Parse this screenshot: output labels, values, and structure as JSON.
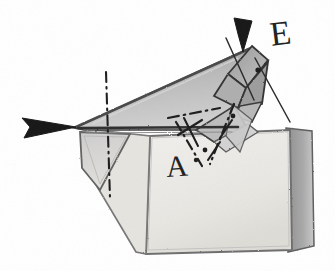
{
  "diagram": {
    "type": "origami-folding-step",
    "background_color": "#ffffff",
    "ink_color": "#232323",
    "labels": [
      {
        "id": "label-A",
        "text": "A",
        "x": 165,
        "y": 152,
        "rotation_deg": -4,
        "font_size_px": 30
      },
      {
        "id": "label-E",
        "text": "E",
        "x": 268,
        "y": 18,
        "rotation_deg": -7,
        "font_size_px": 34
      }
    ],
    "arrows": [
      {
        "name": "left-fold-arrow",
        "direction": "right",
        "style": "solid-filled-triangle",
        "tip_x": 78,
        "tip_y": 127
      },
      {
        "name": "top-fold-arrow",
        "direction": "down-left",
        "style": "solid-tapered-spike",
        "tip_x": 240,
        "tip_y": 48
      }
    ],
    "axis_lines": [
      {
        "name": "vertical-axis-line",
        "style": "dash-dot",
        "from": [
          105,
          72
        ],
        "to": [
          109,
          198
        ]
      },
      {
        "name": "diagonal-axis-line-upper",
        "style": "solid-thin",
        "from": [
          228,
          40
        ],
        "to": [
          250,
          96
        ]
      },
      {
        "name": "diagonal-axis-line-right",
        "style": "solid-thin",
        "from": [
          258,
          62
        ],
        "to": [
          288,
          120
        ]
      }
    ],
    "crease_lines": [
      {
        "name": "main-fold-edge",
        "style": "solid-heavy",
        "from": [
          78,
          127
        ],
        "to": [
          238,
          127
        ]
      },
      {
        "name": "crease-dash-dot-center",
        "style": "dash-dot",
        "from": [
          170,
          113
        ],
        "to": [
          216,
          130
        ]
      },
      {
        "name": "crease-dash-dot-lower",
        "style": "dash-dot",
        "from": [
          182,
          123
        ],
        "to": [
          205,
          164
        ]
      },
      {
        "name": "crease-dash-dot-right",
        "style": "dash-dot",
        "from": [
          232,
          108
        ],
        "to": [
          212,
          162
        ]
      }
    ],
    "shapes": [
      {
        "name": "upper-body-wedge",
        "fill": "#b4b4b4",
        "stroke": "#3a3a3a",
        "role": "folded-gray-body"
      },
      {
        "name": "folded-tip-facets",
        "fill": "#a8a8a8",
        "stroke": "#2f2f2f",
        "role": "apex-facets"
      },
      {
        "name": "left-flap-triangle",
        "fill": "#d5d5d5",
        "stroke": "#555555",
        "role": "left-wing-flap"
      },
      {
        "name": "paper-sheet",
        "fill": "#eceae6",
        "stroke": "#6b6b6b",
        "role": "base-paper"
      },
      {
        "name": "paper-sheet-edge",
        "fill": "#9e9e9e",
        "stroke": "#5a5a5a",
        "role": "paper-thickness"
      }
    ],
    "colors": {
      "body_gray": "#b4b4b4",
      "facet_gray": "#a8a8a8",
      "flap_gray": "#d5d5d5",
      "paper_white": "#eceae6",
      "paper_edge": "#9e9e9e",
      "ink": "#232323"
    }
  }
}
